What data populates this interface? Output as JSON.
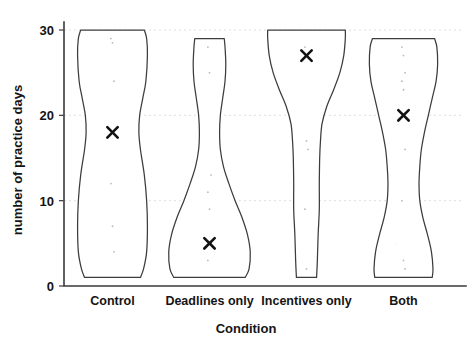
{
  "chart_data": {
    "type": "violin",
    "title": "",
    "xlabel": "Condition",
    "ylabel": "number of practice days",
    "categories": [
      "Control",
      "Deadlines only",
      "Incentives only",
      "Both"
    ],
    "ylim": [
      0,
      30
    ],
    "yticks": [
      0,
      10,
      20,
      30
    ],
    "ytick_labels": [
      "0",
      "10",
      "20",
      "30"
    ],
    "grid": true,
    "legend": "none",
    "marker_symbol": "x",
    "marker_meaning": "mean",
    "means": [
      18,
      5,
      27,
      20
    ],
    "series": [
      {
        "name": "Control",
        "mean": 18,
        "min": 1,
        "max": 30,
        "density": [
          {
            "y": 30,
            "w": 0.82
          },
          {
            "y": 29,
            "w": 0.88
          },
          {
            "y": 27,
            "w": 0.9
          },
          {
            "y": 24,
            "w": 0.86
          },
          {
            "y": 22,
            "w": 0.78
          },
          {
            "y": 20,
            "w": 0.7
          },
          {
            "y": 18,
            "w": 0.68
          },
          {
            "y": 16,
            "w": 0.72
          },
          {
            "y": 13,
            "w": 0.82
          },
          {
            "y": 10,
            "w": 0.88
          },
          {
            "y": 7,
            "w": 0.9
          },
          {
            "y": 4,
            "w": 0.88
          },
          {
            "y": 2,
            "w": 0.8
          },
          {
            "y": 1,
            "w": 0.72
          }
        ],
        "points": [
          29,
          28.5,
          24,
          12,
          7,
          4
        ]
      },
      {
        "name": "Deadlines only",
        "mean": 5,
        "min": 1,
        "max": 29,
        "density": [
          {
            "y": 29,
            "w": 0.38
          },
          {
            "y": 28,
            "w": 0.4
          },
          {
            "y": 26,
            "w": 0.42
          },
          {
            "y": 24,
            "w": 0.4
          },
          {
            "y": 22,
            "w": 0.34
          },
          {
            "y": 20,
            "w": 0.28
          },
          {
            "y": 18,
            "w": 0.26
          },
          {
            "y": 16,
            "w": 0.28
          },
          {
            "y": 14,
            "w": 0.36
          },
          {
            "y": 12,
            "w": 0.5
          },
          {
            "y": 10,
            "w": 0.66
          },
          {
            "y": 8,
            "w": 0.84
          },
          {
            "y": 6,
            "w": 0.98
          },
          {
            "y": 4,
            "w": 1.05
          },
          {
            "y": 2,
            "w": 1.02
          },
          {
            "y": 1,
            "w": 0.92
          }
        ],
        "points": [
          28,
          25,
          13,
          11,
          9,
          5,
          3
        ]
      },
      {
        "name": "Incentives only",
        "mean": 27,
        "min": 1,
        "max": 30,
        "density": [
          {
            "y": 30,
            "w": 1.0
          },
          {
            "y": 29,
            "w": 1.0
          },
          {
            "y": 27,
            "w": 0.96
          },
          {
            "y": 25,
            "w": 0.86
          },
          {
            "y": 23,
            "w": 0.7
          },
          {
            "y": 21,
            "w": 0.52
          },
          {
            "y": 19,
            "w": 0.4
          },
          {
            "y": 17,
            "w": 0.36
          },
          {
            "y": 15,
            "w": 0.34
          },
          {
            "y": 12,
            "w": 0.33
          },
          {
            "y": 9,
            "w": 0.33
          },
          {
            "y": 6,
            "w": 0.3
          },
          {
            "y": 3,
            "w": 0.28
          },
          {
            "y": 1,
            "w": 0.26
          }
        ],
        "points": [
          28,
          17,
          16,
          9,
          2
        ]
      },
      {
        "name": "Both",
        "mean": 20,
        "min": 1,
        "max": 29,
        "density": [
          {
            "y": 29,
            "w": 0.8
          },
          {
            "y": 28,
            "w": 0.86
          },
          {
            "y": 26,
            "w": 0.88
          },
          {
            "y": 24,
            "w": 0.84
          },
          {
            "y": 22,
            "w": 0.74
          },
          {
            "y": 20,
            "w": 0.64
          },
          {
            "y": 18,
            "w": 0.54
          },
          {
            "y": 16,
            "w": 0.46
          },
          {
            "y": 14,
            "w": 0.42
          },
          {
            "y": 12,
            "w": 0.4
          },
          {
            "y": 10,
            "w": 0.42
          },
          {
            "y": 8,
            "w": 0.5
          },
          {
            "y": 6,
            "w": 0.62
          },
          {
            "y": 4,
            "w": 0.72
          },
          {
            "y": 2,
            "w": 0.76
          },
          {
            "y": 1,
            "w": 0.74
          }
        ],
        "points": [
          28,
          27,
          25,
          24,
          23,
          16,
          10,
          3,
          2
        ]
      }
    ]
  }
}
